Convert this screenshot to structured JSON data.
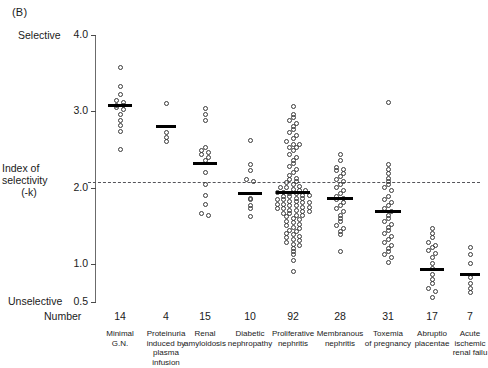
{
  "figure": {
    "panel_label": "(B)",
    "top_axis_label": "Selective",
    "bottom_axis_label": "Unselective",
    "y_axis_title_line1": "Index of",
    "y_axis_title_line2": "selectivity",
    "y_axis_title_line3": "(-k)",
    "number_row_label": "Number"
  },
  "chart_data": {
    "type": "scatter",
    "xlabel": "",
    "ylabel": "Index of selectivity (-k)",
    "ylim": [
      0.5,
      4.0
    ],
    "yticks": [
      4.0,
      3.0,
      2.0,
      1.0,
      0.5
    ],
    "ytick_labels": [
      "4.0",
      "3.0",
      "2.0",
      "1.0",
      "0.5"
    ],
    "y_axis_high_annotation": "Selective",
    "y_axis_low_annotation": "Unselective",
    "reference_line": 2.0,
    "reference_line_style": "dashed",
    "grid": false,
    "legend": "none",
    "marker": "open-circle",
    "mean_marker": "horizontal-bar",
    "categories": [
      {
        "label": "Minimal G.N.",
        "label_lines": [
          "Minimal",
          "G.N."
        ],
        "number": 14,
        "mean": 3.07,
        "values": [
          3.58,
          3.32,
          3.22,
          3.14,
          3.12,
          3.08,
          3.08,
          3.05,
          3.02,
          2.96,
          2.88,
          2.82,
          2.74,
          2.5
        ]
      },
      {
        "label": "Proteinuria induced by plasma infusion",
        "label_lines": [
          "Proteinuria",
          "induced by",
          "plasma",
          "infusion"
        ],
        "number": 4,
        "mean": 2.8,
        "values": [
          3.1,
          2.72,
          2.66,
          2.6
        ]
      },
      {
        "label": "Renal amyloidosis",
        "label_lines": [
          "Renal",
          "amyloidosis"
        ],
        "number": 15,
        "mean": 2.32,
        "values": [
          3.04,
          2.96,
          2.88,
          2.52,
          2.48,
          2.46,
          2.44,
          2.4,
          2.36,
          2.2,
          2.04,
          1.9,
          1.78,
          1.66,
          1.64
        ]
      },
      {
        "label": "Diabetic nephropathy",
        "label_lines": [
          "Diabetic",
          "nephropathy"
        ],
        "number": 10,
        "mean": 1.92,
        "values": [
          2.62,
          2.3,
          2.22,
          2.1,
          2.08,
          1.86,
          1.84,
          1.76,
          1.72,
          1.62
        ]
      },
      {
        "label": "Proliferative nephritis",
        "label_lines": [
          "Proliferative",
          "nephritis"
        ],
        "number": 92,
        "mean": 1.93,
        "values": [
          3.06,
          2.96,
          2.92,
          2.88,
          2.84,
          2.8,
          2.76,
          2.72,
          2.68,
          2.64,
          2.6,
          2.56,
          2.56,
          2.52,
          2.52,
          2.48,
          2.44,
          2.4,
          2.36,
          2.32,
          2.28,
          2.24,
          2.2,
          2.16,
          2.12,
          2.1,
          2.08,
          2.06,
          2.04,
          2.02,
          2.0,
          2.0,
          1.98,
          1.96,
          1.96,
          1.94,
          1.94,
          1.92,
          1.92,
          1.9,
          1.9,
          1.88,
          1.88,
          1.86,
          1.86,
          1.84,
          1.84,
          1.82,
          1.82,
          1.8,
          1.8,
          1.78,
          1.78,
          1.76,
          1.76,
          1.74,
          1.74,
          1.72,
          1.72,
          1.7,
          1.7,
          1.68,
          1.68,
          1.66,
          1.66,
          1.64,
          1.64,
          1.62,
          1.6,
          1.58,
          1.56,
          1.54,
          1.52,
          1.5,
          1.48,
          1.46,
          1.44,
          1.42,
          1.4,
          1.38,
          1.36,
          1.34,
          1.32,
          1.3,
          1.28,
          1.26,
          1.24,
          1.2,
          1.16,
          1.12,
          1.04,
          0.9
        ]
      },
      {
        "label": "Membranous nephritis",
        "label_lines": [
          "Membranous",
          "nephritis"
        ],
        "number": 28,
        "mean": 1.86,
        "values": [
          2.44,
          2.36,
          2.26,
          2.24,
          2.22,
          2.18,
          2.14,
          2.1,
          2.08,
          2.04,
          2.0,
          1.96,
          1.92,
          1.88,
          1.86,
          1.84,
          1.8,
          1.76,
          1.72,
          1.68,
          1.64,
          1.6,
          1.56,
          1.5,
          1.46,
          1.42,
          1.38,
          1.16
        ]
      },
      {
        "label": "Toxemia of pregnancy",
        "label_lines": [
          "Toxemia",
          "of pregnancy"
        ],
        "number": 31,
        "mean": 1.68,
        "values": [
          3.12,
          2.3,
          2.24,
          2.18,
          2.12,
          2.08,
          2.04,
          2.0,
          1.96,
          1.88,
          1.84,
          1.8,
          1.76,
          1.72,
          1.68,
          1.64,
          1.6,
          1.56,
          1.52,
          1.48,
          1.44,
          1.4,
          1.36,
          1.32,
          1.28,
          1.24,
          1.2,
          1.16,
          1.12,
          1.08,
          1.02
        ]
      },
      {
        "label": "Abruptio placentae",
        "label_lines": [
          "Abruptio",
          "placentae"
        ],
        "number": 17,
        "mean": 0.92,
        "values": [
          1.46,
          1.4,
          1.34,
          1.28,
          1.24,
          1.22,
          1.18,
          1.14,
          1.08,
          1.0,
          0.94,
          0.86,
          0.8,
          0.74,
          0.68,
          0.64,
          0.56
        ]
      },
      {
        "label": "Acute ischemic renal failure",
        "label_lines": [
          "Acute",
          "ischemic",
          "renal failu"
        ],
        "number": 7,
        "mean": 0.86,
        "values": [
          1.22,
          1.12,
          1.0,
          0.82,
          0.74,
          0.68,
          0.62
        ]
      }
    ]
  }
}
